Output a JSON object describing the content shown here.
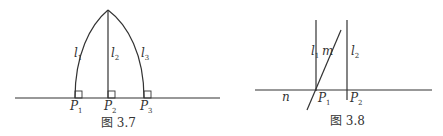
{
  "colors": {
    "line": "#333333",
    "background": "#ffffff"
  },
  "figure_3_7": {
    "caption": "图 3.7",
    "lines": [
      {
        "name": "l",
        "sub": "1"
      },
      {
        "name": "l",
        "sub": "2"
      },
      {
        "name": "l",
        "sub": "3"
      }
    ],
    "points": [
      {
        "name": "P",
        "sub": "1"
      },
      {
        "name": "P",
        "sub": "2"
      },
      {
        "name": "P",
        "sub": "3"
      }
    ]
  },
  "figure_3_8": {
    "caption": "图 3.8",
    "lines": [
      {
        "name": "l",
        "sub": "1"
      },
      {
        "name": "m",
        "sub": ""
      },
      {
        "name": "l",
        "sub": "2"
      },
      {
        "name": "n",
        "sub": ""
      }
    ],
    "points": [
      {
        "name": "P",
        "sub": "1"
      },
      {
        "name": "P",
        "sub": "2"
      }
    ]
  }
}
